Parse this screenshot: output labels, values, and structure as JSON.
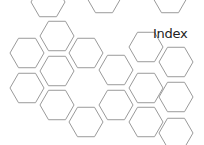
{
  "page": {
    "title": "Index"
  },
  "colors": {
    "background": "#ffffff",
    "hex_stroke": "#9a9a9a",
    "title_text": "#222222"
  },
  "hexagons": [
    [
      48,
      2
    ],
    [
      104,
      -2
    ],
    [
      170,
      -2
    ],
    [
      57,
      36
    ],
    [
      86,
      53
    ],
    [
      27,
      53
    ],
    [
      146,
      47
    ],
    [
      57,
      71
    ],
    [
      116,
      70
    ],
    [
      176,
      62
    ],
    [
      27,
      88
    ],
    [
      146,
      88
    ],
    [
      176,
      97
    ],
    [
      57,
      105
    ],
    [
      116,
      105
    ],
    [
      86,
      122
    ],
    [
      146,
      122
    ],
    [
      176,
      133
    ]
  ]
}
